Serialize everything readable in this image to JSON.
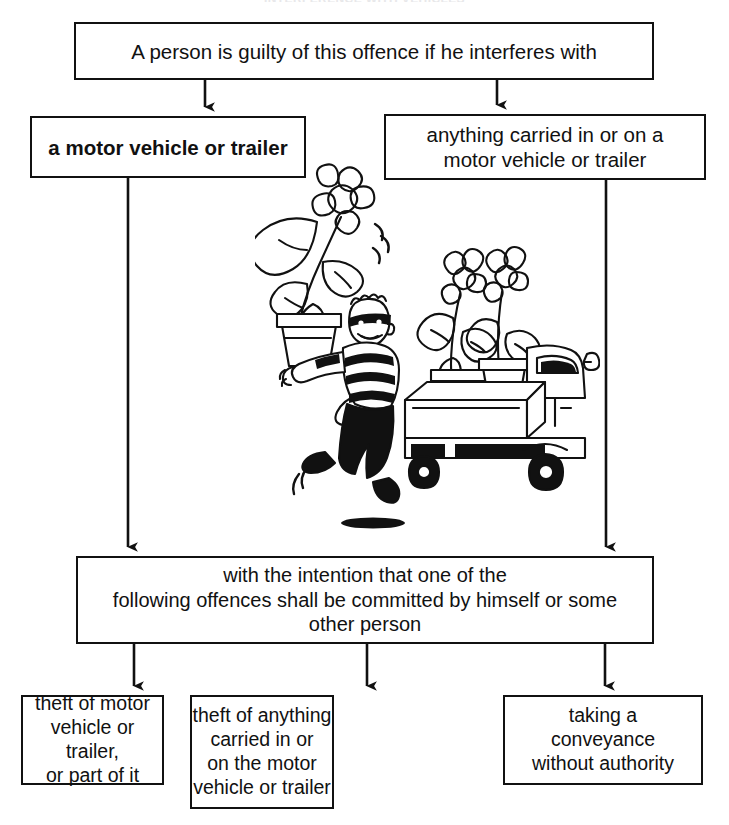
{
  "page": {
    "clipped_header": "INTERFERENCE WITH VEHICLES",
    "background_color": "#ffffff",
    "line_color": "#111111"
  },
  "flow": {
    "top": {
      "id": "premise",
      "text": "A person is guilty of this offence if he interferes with"
    },
    "branches": [
      {
        "id": "motor-vehicle",
        "text": "a motor vehicle or trailer",
        "bold": true
      },
      {
        "id": "carried-goods",
        "text": "anything carried in or on a\nmotor vehicle or trailer",
        "bold": false
      }
    ],
    "intention": {
      "id": "intention",
      "text": "with the intention that one of the\nfollowing offences shall be committed by himself or some\nother person"
    },
    "outcomes": [
      {
        "id": "theft-of-vehicle",
        "text": "theft of motor\nvehicle or trailer,\nor part of it"
      },
      {
        "id": "theft-of-contents",
        "text": "theft of anything\ncarried in or\non the motor\nvehicle or trailer"
      },
      {
        "id": "taking-conveyance",
        "text": "taking a\nconveyance\nwithout authority"
      }
    ]
  },
  "illustration": {
    "name": "thief-carrying-plant-and-pickup-truck",
    "description": "Cartoon line drawing: a masked burglar in a striped shirt runs away carrying a potted flowering plant, beside a pickup truck loaded with two potted flowering plants in its open bed.",
    "elements": [
      "burglar-figure",
      "striped-shirt",
      "eye-mask",
      "carried-flower-pot",
      "large-flower",
      "pickup-truck",
      "truck-bed-plants",
      "motion-lines",
      "ground-shadow"
    ],
    "ink_color": "#111111"
  },
  "connectors": [
    {
      "id": "premise-to-motor-vehicle",
      "from": "premise",
      "to": "motor-vehicle"
    },
    {
      "id": "premise-to-carried-goods",
      "from": "premise",
      "to": "carried-goods"
    },
    {
      "id": "motor-vehicle-to-intention",
      "from": "motor-vehicle",
      "to": "intention"
    },
    {
      "id": "carried-goods-to-intention",
      "from": "carried-goods",
      "to": "intention"
    },
    {
      "id": "intention-to-theft-of-vehicle",
      "from": "intention",
      "to": "theft-of-vehicle"
    },
    {
      "id": "intention-to-theft-of-contents",
      "from": "intention",
      "to": "theft-of-contents"
    },
    {
      "id": "intention-to-taking-conveyance",
      "from": "intention",
      "to": "taking-conveyance"
    }
  ]
}
